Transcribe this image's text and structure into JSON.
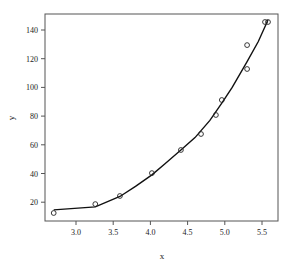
{
  "chart_data": {
    "type": "scatter",
    "title": "",
    "xlabel": "x",
    "ylabel": "y",
    "xlim": [
      2.6,
      5.7
    ],
    "ylim": [
      8,
      150
    ],
    "grid": false,
    "legend": null,
    "x_ticks": [
      3.0,
      3.5,
      4.0,
      4.5,
      5.0,
      5.5
    ],
    "x_tick_labels": [
      "3.0",
      "3.5",
      "4.0",
      "4.5",
      "5.0",
      "5.5"
    ],
    "y_ticks": [
      20,
      40,
      60,
      80,
      100,
      120,
      140
    ],
    "y_tick_labels": [
      "20",
      "40",
      "60",
      "80",
      "100",
      "120",
      "140"
    ],
    "series": [
      {
        "name": "observed",
        "kind": "points",
        "marker": "open-circle",
        "x": [
          2.7,
          3.26,
          3.59,
          4.02,
          4.41,
          4.68,
          4.88,
          4.96,
          5.3,
          5.3,
          5.54,
          5.58
        ],
        "y": [
          12.5,
          18.7,
          24.3,
          40.3,
          56.4,
          67.5,
          80.8,
          91.2,
          112.8,
          129.5,
          145.6,
          145.6
        ]
      },
      {
        "name": "fitted",
        "kind": "line",
        "x": [
          2.7,
          3.26,
          3.59,
          3.8,
          4.02,
          4.2,
          4.41,
          4.6,
          4.8,
          4.96,
          5.1,
          5.3,
          5.45,
          5.58
        ],
        "y": [
          14.6,
          16.7,
          24.0,
          31.0,
          39.0,
          47.0,
          56.4,
          65.0,
          77.0,
          89.0,
          100.0,
          118.0,
          132.0,
          147.0
        ]
      }
    ],
    "colors": {
      "points": "#222222",
      "line": "#111111",
      "axes": "#555555"
    }
  }
}
